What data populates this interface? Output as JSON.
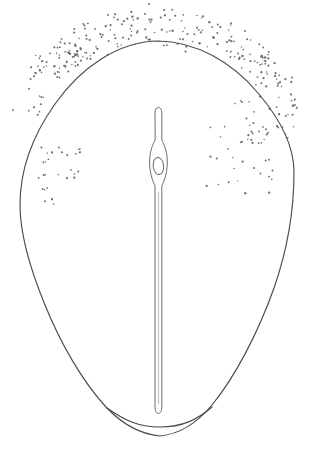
{
  "figure": {
    "background_color": "#ffffff",
    "canvas": {
      "width": 310,
      "height": 454
    }
  },
  "outline": {
    "name": "seed-outline",
    "stroke_color": "#4a4a50",
    "stroke_width": 1.15,
    "fill": "none",
    "apex_point": [
      158,
      41
    ],
    "left_extent": [
      20,
      205
    ],
    "right_extent": [
      294,
      170
    ],
    "base_point": [
      160,
      437
    ],
    "path": "M158 41 C 196 41.5 232 62 258 93 C 281 120 294 146 294 172 C 294 206 288 248 274 288 C 258 333 235 377 212 405 C 197 423 181 434 160 436 C 139 434 122 424 106 407 C 82 381 60 342 45 305 C 29 266 20 231 20 205 C 20 170 33 135 55 104 C 80 68 118 41.5 158 41 Z",
    "basal_notch_path": "M107 408 C 124 420 138 427 160 427 C 182 427 197 420 212 407"
  },
  "embryo": {
    "name": "central-embryo",
    "stroke_color": "#6b6b72",
    "stroke_width": 1.0,
    "tip_y": 108,
    "base_y": 414,
    "center_x": 158,
    "shaft_width": 7,
    "bulb_top_y": 148,
    "bulb_bottom_y": 190,
    "bulb_width": 19,
    "path": "M155 113 C 155 109.5 156.4 107.6 158.4 107.6 C 160.4 107.6 161.8 109.5 161.8 113 L 161.8 140 C 163.5 144 167.3 150 167.3 162 C 167.3 174 163.6 182 161.8 186 L 161.8 406 C 161.8 411 160.6 413.4 158.4 413.4 C 156.2 413.4 155 411 155 406 L 155 186 C 153.2 182 149.6 174 149.6 162 C 149.6 150 153.3 144 155 140 Z",
    "inner_shade_path": "M158.6 192 L158.6 404"
  },
  "nucleus": {
    "name": "embryo-nucleus-oval",
    "stroke_color": "#6b6b72",
    "stroke_width": 1.0,
    "center": [
      158.4,
      166
    ],
    "rx": 5.2,
    "ry": 8.6,
    "rotation": -6
  },
  "stippling": {
    "name": "stipple-shading",
    "dot_color": "#6e6e76",
    "dot_radius": 0.95,
    "description": "dense stipple band across the apex (inside and outside the outline) thinning down both flanks, plus isolated clusters mid-left and mid-right",
    "clusters": [
      {
        "region": "apex-outer",
        "count": 96,
        "seed": 11,
        "band": {
          "cx": 158,
          "cy": 76,
          "rx": 118,
          "ry": 62,
          "angle_from": 196,
          "angle_to": 344,
          "radial_spread": 34,
          "radial_offset": -16
        },
        "jitter": 7
      },
      {
        "region": "apex-inner",
        "count": 88,
        "seed": 29,
        "band": {
          "cx": 158,
          "cy": 92,
          "rx": 112,
          "ry": 64,
          "angle_from": 192,
          "angle_to": 348,
          "radial_spread": 30,
          "radial_offset": 6
        },
        "jitter": 8
      },
      {
        "region": "left-flank",
        "count": 34,
        "seed": 47,
        "band": {
          "cx": 150,
          "cy": 112,
          "rx": 118,
          "ry": 76,
          "angle_from": 178,
          "angle_to": 232,
          "radial_spread": 28,
          "radial_offset": 2
        },
        "jitter": 9
      },
      {
        "region": "right-flank",
        "count": 52,
        "seed": 61,
        "band": {
          "cx": 166,
          "cy": 118,
          "rx": 120,
          "ry": 80,
          "angle_from": 308,
          "angle_to": 372,
          "radial_spread": 34,
          "radial_offset": 0
        },
        "jitter": 10
      },
      {
        "region": "left-mid-cluster",
        "count": 22,
        "seed": 83,
        "box": {
          "x": 36,
          "y": 146,
          "w": 44,
          "h": 34
        },
        "jitter": 2
      },
      {
        "region": "left-lower-sparse",
        "count": 6,
        "seed": 97,
        "box": {
          "x": 34,
          "y": 182,
          "w": 22,
          "h": 26
        },
        "jitter": 2
      },
      {
        "region": "right-mid-sparse",
        "count": 26,
        "seed": 113,
        "box": {
          "x": 206,
          "y": 120,
          "w": 76,
          "h": 76
        },
        "jitter": 3
      },
      {
        "region": "right-inner-arc",
        "count": 20,
        "seed": 131,
        "band": {
          "cx": 170,
          "cy": 142,
          "rx": 96,
          "ry": 64,
          "angle_from": 316,
          "angle_to": 366,
          "radial_spread": 18,
          "radial_offset": -6
        },
        "jitter": 6
      }
    ]
  }
}
